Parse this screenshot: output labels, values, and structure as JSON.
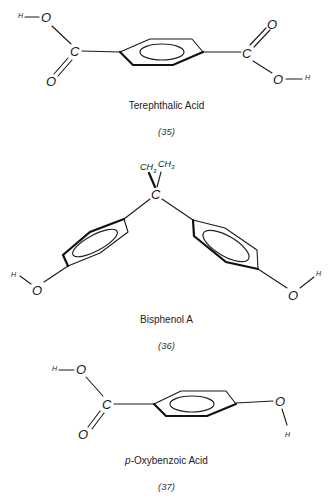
{
  "compounds": [
    {
      "name": "Terephthalic Acid",
      "number": "(35)",
      "atoms": {
        "left_h": "H",
        "left_o_top": "O",
        "left_c": "C",
        "left_o_bottom": "O",
        "right_c": "C",
        "right_o_top": "O",
        "right_o_bottom": "O",
        "right_h": "H"
      }
    },
    {
      "name": "Bisphenol A",
      "number": "(36)",
      "atoms": {
        "ch3_left": "CH",
        "ch3_left_sub": "3",
        "ch3_right": "CH",
        "ch3_right_sub": "3",
        "center_c": "C",
        "left_h": "H",
        "left_o": "O",
        "right_h": "H",
        "right_o": "O"
      }
    },
    {
      "name_prefix": "p",
      "name_rest": "-Oxybenzoic Acid",
      "number": "(37)",
      "atoms": {
        "left_h": "H",
        "left_o_top": "O",
        "left_c": "C",
        "left_o_bottom": "O",
        "right_o": "O",
        "right_h": "H"
      }
    }
  ]
}
